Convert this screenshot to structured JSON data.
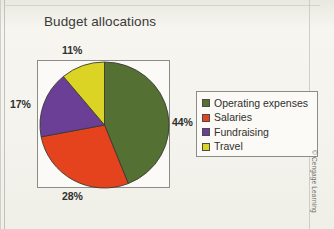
{
  "chart_data": {
    "type": "pie",
    "title": "Budget allocations",
    "labels": [
      "Operating expenses",
      "Salaries",
      "Fundraising",
      "Travel"
    ],
    "values": [
      44,
      28,
      17,
      11
    ],
    "value_labels": [
      "44%",
      "28%",
      "17%",
      "11%"
    ],
    "colors": [
      "#557033",
      "#e5431d",
      "#6b3f96",
      "#dbd424"
    ],
    "units": "percent",
    "start_angle_deg": 0,
    "direction": "clockwise",
    "legend_position": "right",
    "grid": false,
    "xlabel": "",
    "ylabel": "",
    "annotations": []
  },
  "legend": {
    "items": [
      {
        "label": "Operating expenses",
        "color": "#557033"
      },
      {
        "label": "Salaries",
        "color": "#e5431d"
      },
      {
        "label": "Fundraising",
        "color": "#6b3f96"
      },
      {
        "label": "Travel",
        "color": "#dbd424"
      }
    ]
  },
  "callouts": {
    "travel": "11%",
    "operating_expenses": "44%",
    "salaries": "28%",
    "fundraising": "17%"
  },
  "credit": "© Cengage Learning"
}
